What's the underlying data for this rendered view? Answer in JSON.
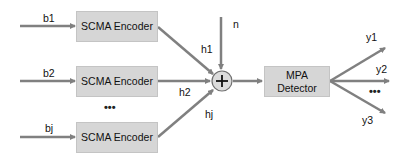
{
  "diagram": {
    "inputs": [
      {
        "label": "b1",
        "encoder": "SCMA Encoder",
        "channel": "h1"
      },
      {
        "label": "b2",
        "encoder": "SCMA Encoder",
        "channel": "h2"
      },
      {
        "label": "bj",
        "encoder": "SCMA Encoder",
        "channel": "hj"
      }
    ],
    "encoder_ellipsis": "•••",
    "noise_label": "n",
    "sum_symbol": "+",
    "detector": {
      "line1": "MPA",
      "line2": "Detector"
    },
    "outputs": [
      {
        "label": "y1"
      },
      {
        "label": "y2"
      },
      {
        "label": "y3"
      }
    ],
    "output_ellipsis": "•••",
    "colors": {
      "block_fill": "#d6d6d6",
      "arrow": "#808080",
      "sum_fill": "#dcdcdc"
    }
  }
}
